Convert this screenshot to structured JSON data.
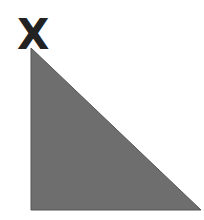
{
  "diagram": {
    "vertex_label": "X",
    "triangle": {
      "fill": "#6e6e6e",
      "stroke": "#555555",
      "points": "31,48 31,210 201,210"
    },
    "label_color": "#222222",
    "background": "#ffffff"
  }
}
